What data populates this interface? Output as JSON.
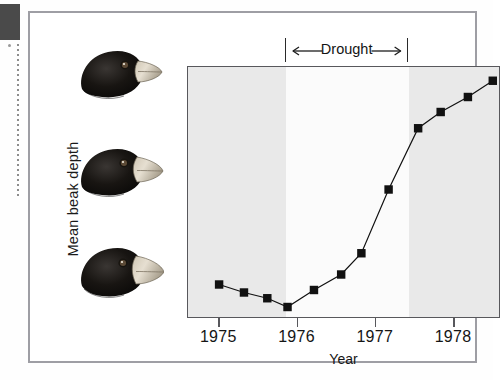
{
  "figure": {
    "caption_elements": {
      "y_axis_title": "Mean beak depth",
      "x_axis_title": "Year",
      "annotation_label": "Drought"
    },
    "illustrations": [
      {
        "name": "finch-head-1975"
      },
      {
        "name": "finch-head-1977"
      },
      {
        "name": "finch-head-1978"
      }
    ]
  },
  "chart_data": {
    "type": "line",
    "title": "",
    "xlabel": "Year",
    "ylabel": "Mean beak depth",
    "xlim": [
      1974.6,
      1978.6
    ],
    "ylim": [
      0,
      1
    ],
    "grid": false,
    "legend": null,
    "xticks": [
      1975,
      1976,
      1977,
      1978
    ],
    "xticklabels": [
      "1975",
      "1976",
      "1977",
      "1978"
    ],
    "yticks": [],
    "yticklabels": [],
    "annotations": [
      {
        "text": "Drought",
        "type": "span-bracket",
        "x_start": 1975.85,
        "x_end": 1977.43,
        "arrows": "both"
      }
    ],
    "shaded_bands": [
      {
        "x_start": 1974.6,
        "x_end": 1975.85,
        "color": "#e9e9e9",
        "label": "pre-drought"
      },
      {
        "x_start": 1975.85,
        "x_end": 1977.43,
        "color": "#fbfbfb",
        "label": "drought"
      },
      {
        "x_start": 1977.43,
        "x_end": 1978.6,
        "color": "#e9e9e9",
        "label": "post-drought"
      }
    ],
    "series": [
      {
        "name": "Mean beak depth",
        "marker": "square",
        "color": "#111111",
        "x": [
          1975.0,
          1975.32,
          1975.62,
          1975.88,
          1976.22,
          1976.57,
          1976.83,
          1977.18,
          1977.56,
          1977.85,
          1978.2,
          1978.52
        ],
        "y": [
          0.13,
          0.098,
          0.075,
          0.04,
          0.108,
          0.17,
          0.255,
          0.51,
          0.755,
          0.82,
          0.88,
          0.945
        ]
      }
    ]
  }
}
